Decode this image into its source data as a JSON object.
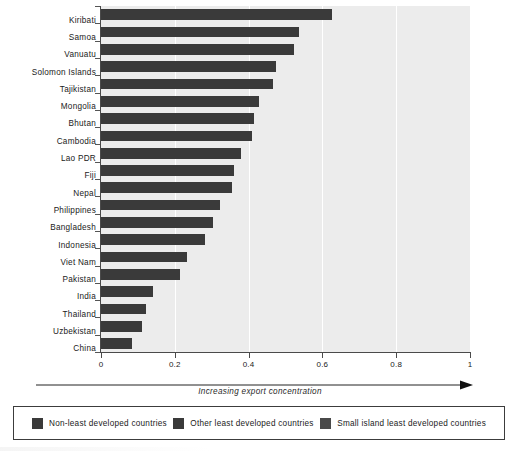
{
  "chart_data": {
    "type": "bar",
    "orientation": "horizontal",
    "title": "",
    "subtitle": "",
    "xlabel": "Increasing export concentration",
    "ylabel": "",
    "xlim": [
      0,
      1
    ],
    "grid": true,
    "grid_axis": "x",
    "legend_position": "bottom",
    "categories": [
      "Kiribati",
      "Samoa",
      "Vanuatu",
      "Solomon Islands",
      "Tajikistan",
      "Mongolia",
      "Bhutan",
      "Cambodia",
      "Lao PDR",
      "Fiji",
      "Nepal",
      "Philippines",
      "Bangladesh",
      "Indonesia",
      "Viet Nam",
      "Pakistan",
      "India",
      "Thailand",
      "Uzbekistan",
      "China"
    ],
    "values": [
      0.626,
      0.537,
      0.523,
      0.474,
      0.466,
      0.428,
      0.415,
      0.409,
      0.379,
      0.361,
      0.354,
      0.322,
      0.304,
      0.282,
      0.232,
      0.214,
      0.142,
      0.121,
      0.111,
      0.083
    ],
    "groups": [
      "Small island least developed countries",
      "Small island least developed countries",
      "Small island least developed countries",
      "Small island least developed countries",
      "Other least developed countries",
      "Non-least developed countries",
      "Other least developed countries",
      "Other least developed countries",
      "Other least developed countries",
      "Non-least developed countries",
      "Other least developed countries",
      "Non-least developed countries",
      "Other least developed countries",
      "Non-least developed countries",
      "Non-least developed countries",
      "Non-least developed countries",
      "Non-least developed countries",
      "Non-least developed countries",
      "Non-least developed countries",
      "Non-least developed countries"
    ],
    "xticks": [
      "0",
      "0.2",
      "0.4",
      "0.6",
      "0.8",
      "1"
    ],
    "xtick_values": [
      0,
      0.2,
      0.4,
      0.6,
      0.8,
      1
    ],
    "bar_color": "#3a3a3a",
    "plot_background": "#ececec"
  },
  "axis": {
    "title": "Increasing export concentration",
    "arrow_direction": "right"
  },
  "legend": {
    "items": [
      {
        "label": "Non-least developed countries",
        "color": "#3a3a3a"
      },
      {
        "label": "Other least developed countries",
        "color": "#3a3a3a"
      },
      {
        "label": "Small island least developed countries",
        "color": "#4a4a4a"
      }
    ]
  }
}
